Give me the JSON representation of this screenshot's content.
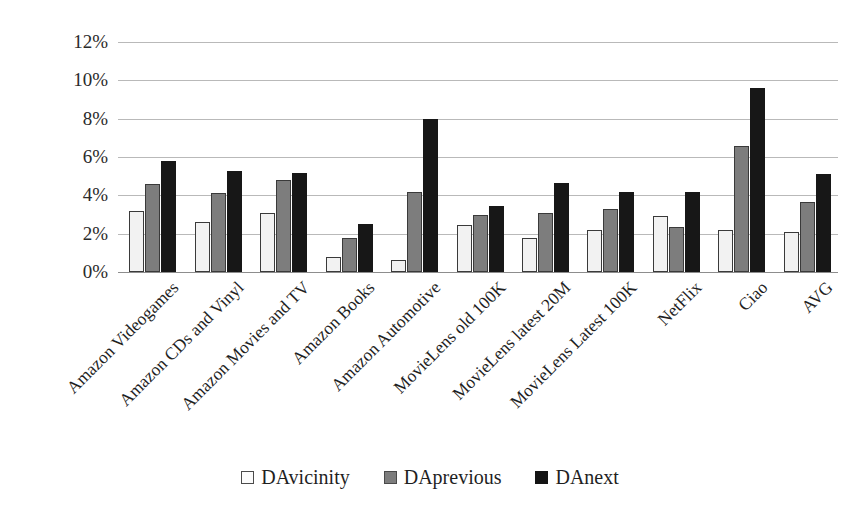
{
  "chart_data": {
    "type": "bar",
    "title": "",
    "xlabel": "",
    "ylabel": "",
    "ylim": [
      0,
      12
    ],
    "ytick_labels": [
      "12%",
      "10%",
      "8%",
      "6%",
      "4%",
      "2%",
      "0%"
    ],
    "ytick_values": [
      12,
      10,
      8,
      6,
      4,
      2,
      0
    ],
    "ytick_step": 2,
    "grid": true,
    "value_unit": "%",
    "legend_position": "bottom-center",
    "categories": [
      "Amazon Videogames",
      "Amazon CDs and Vinyl",
      "Amazon Movies and TV",
      "Amazon Books",
      "Amazon Automotive",
      "MovieLens old 100K",
      "MovieLens latest 20M",
      "MovieLens Latest 100K",
      "NetFlix",
      "Ciao",
      "AVG"
    ],
    "series": [
      {
        "name": "DAvicinity",
        "color": "#f2f2f2",
        "values": [
          3.2,
          2.6,
          3.1,
          0.8,
          0.65,
          2.45,
          1.75,
          2.2,
          2.9,
          2.2,
          2.1
        ]
      },
      {
        "name": "DAprevious",
        "color": "#7d7d7d",
        "values": [
          4.6,
          4.1,
          4.8,
          1.8,
          4.15,
          3.0,
          3.1,
          3.3,
          2.35,
          6.6,
          3.65
        ]
      },
      {
        "name": "DAnext",
        "color": "#171717",
        "values": [
          5.8,
          5.25,
          5.15,
          2.5,
          8.0,
          3.45,
          4.65,
          4.2,
          4.2,
          9.6,
          5.1
        ]
      }
    ]
  },
  "legend": {
    "items": [
      {
        "label": "DAvicinity",
        "swatch": "swatch-vicinity"
      },
      {
        "label": "DAprevious",
        "swatch": "swatch-previous"
      },
      {
        "label": "DAnext",
        "swatch": "swatch-next"
      }
    ]
  }
}
